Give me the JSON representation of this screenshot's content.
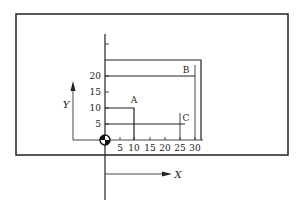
{
  "diagram": {
    "type": "datum-coordinate-dimensioning",
    "axes": {
      "x_label": "X",
      "y_label": "Y",
      "x_ticks": [
        "5",
        "10",
        "15",
        "20",
        "25",
        "30"
      ],
      "y_ticks": [
        "5",
        "10",
        "15",
        "20"
      ]
    },
    "features": [
      {
        "label": "A",
        "x": 10,
        "y": 10
      },
      {
        "label": "B",
        "x": 30,
        "y": 20
      },
      {
        "label": "C",
        "x": 25,
        "y": 5
      }
    ],
    "origin_symbol": "datum-target-icon",
    "colors": {
      "line": "#222222",
      "background": "#ffffff"
    }
  }
}
